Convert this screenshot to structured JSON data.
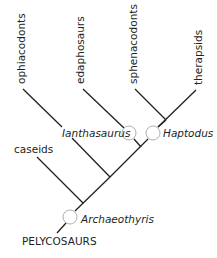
{
  "diagram": {
    "type": "cladogram",
    "root": {
      "label": "PELYCOSAURS"
    },
    "terminal_taxa": [
      {
        "id": "ophiacodonts",
        "label": "ophiacodonts"
      },
      {
        "id": "edaphosaurs",
        "label": "edaphosaurs"
      },
      {
        "id": "sphenacodonts",
        "label": "sphenacodonts"
      },
      {
        "id": "therapsids",
        "label": "therapsids"
      },
      {
        "id": "caseids",
        "label": "caseids"
      }
    ],
    "nodes": [
      {
        "id": "archaeothyris",
        "label": "Archaeothyris"
      },
      {
        "id": "ianthasaurus",
        "label": "Ianthasaurus"
      },
      {
        "id": "haptodus",
        "label": "Haptodus"
      }
    ],
    "colors": {
      "line": "#231f20",
      "circle_stroke": "#9a9a9a",
      "background": "#ffffff"
    }
  }
}
